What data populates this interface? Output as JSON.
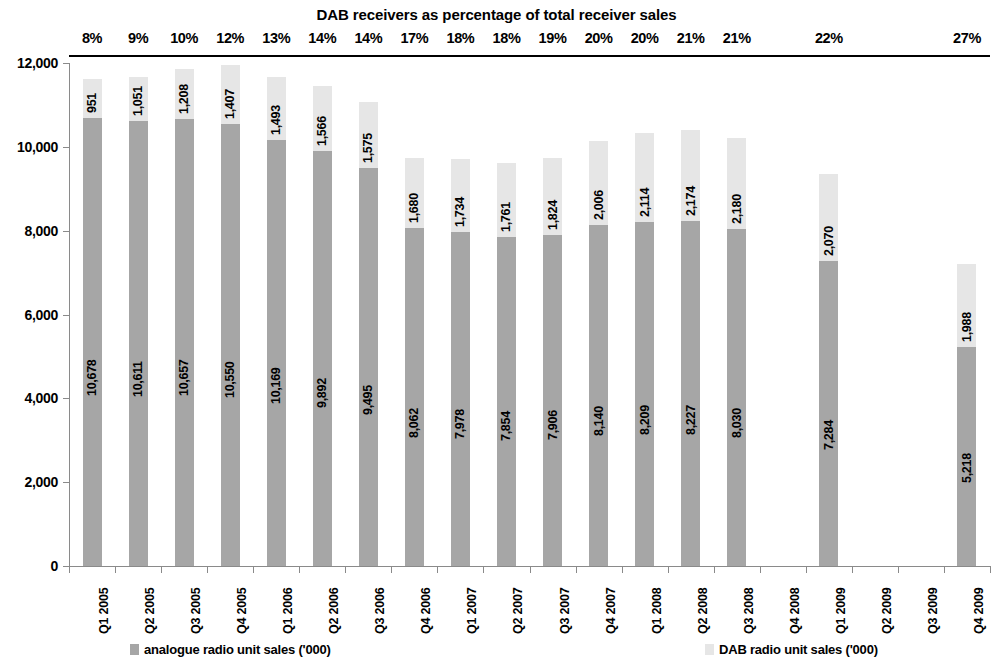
{
  "chart_data": {
    "type": "bar",
    "subtype": "stacked-column",
    "title": "DAB receivers as percentage of total receiver sales",
    "xlabel": "",
    "ylabel": "",
    "ylim": [
      0,
      12000
    ],
    "ytick_labels": [
      "0",
      "2,000",
      "4,000",
      "6,000",
      "8,000",
      "10,000",
      "12,000"
    ],
    "ytick_values": [
      0,
      2000,
      4000,
      6000,
      8000,
      10000,
      12000
    ],
    "grid": false,
    "legend_position": "bottom",
    "categories": [
      "Q1 2005",
      "Q2 2005",
      "Q3 2005",
      "Q4 2005",
      "Q1 2006",
      "Q2 2006",
      "Q3 2006",
      "Q4 2006",
      "Q1 2007",
      "Q2 2007",
      "Q3 2007",
      "Q4 2007",
      "Q1 2008",
      "Q2 2008",
      "Q3 2008",
      "Q4 2008",
      "Q1 2009",
      "Q2 2009",
      "Q3 2009",
      "Q4 2009"
    ],
    "series": [
      {
        "name": "analogue radio unit sales ('000)",
        "color": "#a6a6a6",
        "values": [
          10678,
          10611,
          10657,
          10550,
          10169,
          9892,
          9495,
          8062,
          7978,
          7854,
          7906,
          8140,
          8209,
          8227,
          8030,
          null,
          7284,
          null,
          null,
          5218
        ],
        "labels": [
          "10,678",
          "10,611",
          "10,657",
          "10,550",
          "10,169",
          "9,892",
          "9,495",
          "8,062",
          "7,978",
          "7,854",
          "7,906",
          "8,140",
          "8,209",
          "8,227",
          "8,030",
          "",
          "7,284",
          "",
          "",
          "5,218"
        ]
      },
      {
        "name": "DAB radio unit sales ('000)",
        "color": "#e6e6e6",
        "values": [
          951,
          1051,
          1208,
          1407,
          1493,
          1566,
          1575,
          1680,
          1734,
          1761,
          1824,
          2006,
          2114,
          2174,
          2180,
          null,
          2070,
          null,
          null,
          1988
        ],
        "labels": [
          "951",
          "1,051",
          "1,208",
          "1,407",
          "1,493",
          "1,566",
          "1,575",
          "1,680",
          "1,734",
          "1,761",
          "1,824",
          "2,006",
          "2,114",
          "2,174",
          "2,180",
          "",
          "2,070",
          "",
          "",
          "1,988"
        ]
      }
    ],
    "annotations": {
      "label": "DAB receivers as percentage of total receiver sales",
      "values": [
        "8%",
        "9%",
        "10%",
        "12%",
        "13%",
        "14%",
        "14%",
        "17%",
        "18%",
        "18%",
        "19%",
        "20%",
        "20%",
        "21%",
        "21%",
        "",
        "22%",
        "",
        "",
        "27%"
      ]
    }
  }
}
